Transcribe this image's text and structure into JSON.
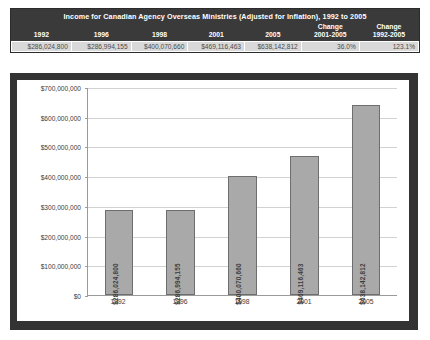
{
  "table": {
    "title": "Income for Canadian Agency Overseas Ministries (Adjusted for Inflation), 1992 to 2005",
    "headers": [
      "1992",
      "1996",
      "1998",
      "2001",
      "2005"
    ],
    "change_headers": [
      {
        "line1": "Change",
        "line2": "2001-2005"
      },
      {
        "line1": "Change",
        "line2": "1992-2005"
      }
    ],
    "values": [
      "$286,024,800",
      "$286,994,155",
      "$400,070,660",
      "$469,116,463",
      "$638,142,812"
    ],
    "change_values": [
      "36.0%",
      "123.1%"
    ]
  },
  "chart_data": {
    "type": "bar",
    "title": "",
    "xlabel": "",
    "ylabel": "",
    "categories": [
      "1992",
      "1996",
      "1998",
      "2001",
      "2005"
    ],
    "values": [
      286024800,
      286994155,
      400070660,
      469116463,
      638142812
    ],
    "data_labels": [
      "$286,024,800",
      "$286,994,155",
      "$400,070,660",
      "$469,116,463",
      "$638,142,812"
    ],
    "ylim": [
      0,
      700000000
    ],
    "ytick_labels": [
      "$700,000,000",
      "$600,000,000",
      "$500,000,000",
      "$400,000,000",
      "$300,000,000",
      "$200,000,000",
      "$100,000,000",
      "$0"
    ],
    "ytick_values": [
      700000000,
      600000000,
      500000000,
      400000000,
      300000000,
      200000000,
      100000000,
      0
    ],
    "grid": true,
    "legend": "none",
    "bar_color": "#a9a9a9",
    "bar_border_color": "#6e6e6e",
    "plot_background": "#ffffff",
    "frame_color": "#333333"
  }
}
